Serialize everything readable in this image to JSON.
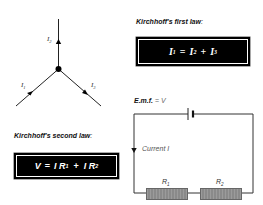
{
  "junction": {
    "labels": {
      "i1": "I",
      "i1_sub": "1",
      "i2": "I",
      "i2_sub": "2",
      "i3": "I",
      "i3_sub": "3"
    }
  },
  "first_law": {
    "heading": "Kirchhoff's first law",
    "colon": ":",
    "equation": {
      "lhs": "I",
      "lhs_sub": "1",
      "eq": "=",
      "t1": "I",
      "t1_sub": "2",
      "plus": "+",
      "t2": "I",
      "t2_sub": "3"
    }
  },
  "second_law": {
    "heading": "Kirchhoff's second law",
    "colon": ":",
    "equation": {
      "lhs": "V",
      "eq": "=",
      "t1": "I R",
      "t1_sub": "1",
      "plus": "+",
      "t2": "I R",
      "t2_sub": "2"
    }
  },
  "circuit": {
    "emf_label": "E.m.f.",
    "emf_eq": "=",
    "emf_value": "V",
    "current_label": "Current I",
    "r1": "R",
    "r1_sub": "1",
    "r2": "R",
    "r2_sub": "2"
  },
  "colors": {
    "box": "#000000",
    "text_on_box": "#ffffff",
    "resistor": "#8a8a8a",
    "wire": "#333333"
  }
}
